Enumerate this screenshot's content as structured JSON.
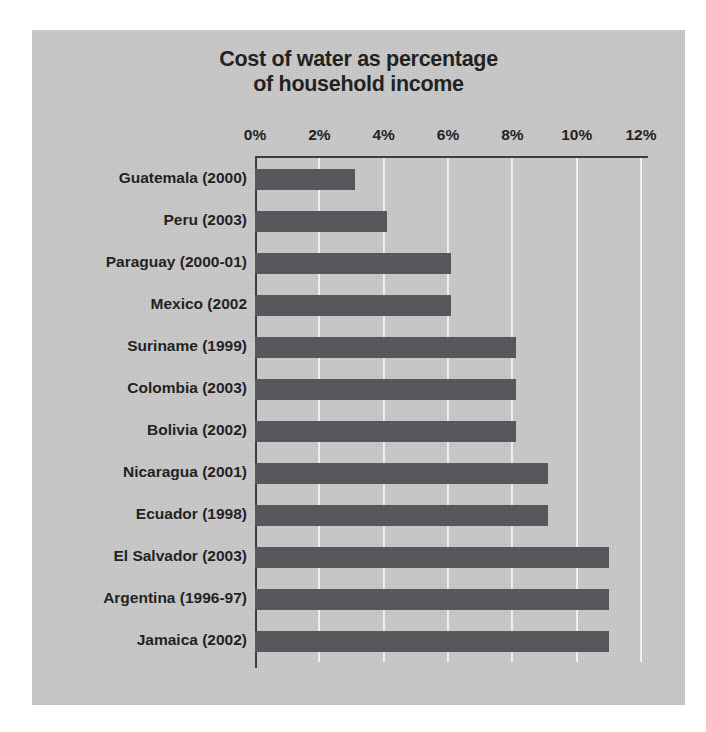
{
  "chart_data": {
    "type": "bar",
    "orientation": "horizontal",
    "title": "Cost of water as percentage\nof household income",
    "title_line1": "Cost of water as percentage",
    "title_line2": "of household income",
    "xlabel": "",
    "ylabel": "",
    "xlim": [
      0,
      12
    ],
    "grid": true,
    "legend": null,
    "axis_unit": "%",
    "tick_labels": [
      "0%",
      "2%",
      "4%",
      "6%",
      "8%",
      "10%",
      "12%"
    ],
    "ticks": [
      0,
      2,
      4,
      6,
      8,
      10,
      12
    ],
    "categories": [
      "Guatemala (2000)",
      "Peru (2003)",
      "Paraguay (2000-01)",
      "Mexico (2002",
      "Suriname (1999)",
      "Colombia (2003)",
      "Bolivia (2002)",
      "Nicaragua (2001)",
      "Ecuador (1998)",
      "El Salvador (2003)",
      "Argentina (1996-97)",
      "Jamaica (2002)"
    ],
    "values": [
      3.1,
      4.1,
      6.1,
      6.1,
      8.1,
      8.1,
      8.1,
      9.1,
      9.1,
      11.0,
      11.0,
      11.0
    ]
  },
  "colors": {
    "panel_background": "#c9c9c9",
    "bar": "#56565a",
    "gridline": "#f4f4f4",
    "axis": "#3a3a3a",
    "text": "#1d1d1d",
    "page_background": "#ffffff"
  }
}
